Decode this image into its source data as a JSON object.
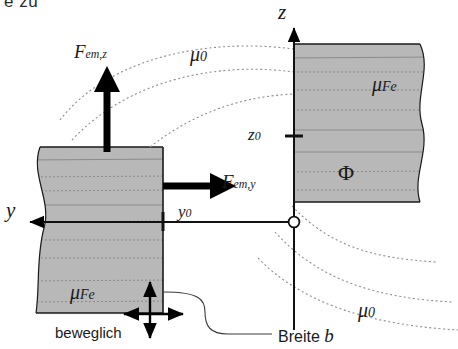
{
  "figure": {
    "title_fragment": "e zu",
    "type": "technical-diagram",
    "description_domain": "electromagnetic actuator cross-section"
  },
  "colors": {
    "iron_fill": "#b8b8b8",
    "iron_edge": "#1a1a1a",
    "flux_line": "#8d8d8d",
    "axis": "#111111",
    "arrow": "#000000",
    "background": "#ffffff"
  },
  "axes": {
    "z": {
      "label": "z",
      "direction": "up",
      "tick_label": "z",
      "tick_sub": "0"
    },
    "y": {
      "label": "y",
      "direction": "left",
      "tick_label": "y",
      "tick_sub": "0"
    },
    "origin_marker": "open-circle"
  },
  "forces": [
    {
      "name": "F_em_z",
      "base": "F",
      "sub": "em,z",
      "direction": "up",
      "label": "F"
    },
    {
      "name": "F_em_y",
      "base": "F",
      "sub": "em,y",
      "direction": "right",
      "label": "F"
    }
  ],
  "materials": [
    {
      "name": "mu_0_top",
      "base": "μ",
      "sub": "0",
      "region": "air-gap-upper"
    },
    {
      "name": "mu_0_bottom",
      "base": "μ",
      "sub": "0",
      "region": "air-gap-lower"
    },
    {
      "name": "mu_Fe_right",
      "base": "μ",
      "sub": "Fe",
      "region": "iron-block-right"
    },
    {
      "name": "mu_Fe_left",
      "base": "μ",
      "sub": "Fe",
      "region": "iron-block-left"
    }
  ],
  "flux": {
    "symbol": "Φ",
    "name": "magnetic-flux"
  },
  "annotations": {
    "movable": "beweglich",
    "width_text": "Breite",
    "width_symbol": "b",
    "movable_arrows": "cross-arrows-four-way"
  },
  "ticks": {
    "z0_text": "z",
    "z0_sub": "0",
    "y0_text": "y",
    "y0_sub": "0"
  }
}
